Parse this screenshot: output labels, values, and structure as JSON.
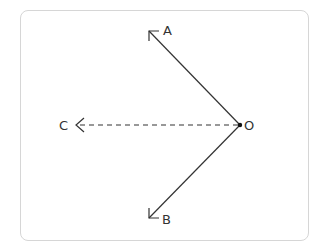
{
  "diagram": {
    "type": "vector-angle",
    "frame": {
      "border_color": "#d6d6d6",
      "background": "#ffffff"
    },
    "origin": {
      "label": "O",
      "x": 240,
      "y": 125
    },
    "rays": [
      {
        "id": "OA",
        "label": "A",
        "from": "O",
        "tip": {
          "x": 149,
          "y": 31
        },
        "style": "solid",
        "label_pos": {
          "x": 168,
          "y": 35
        }
      },
      {
        "id": "OB",
        "label": "B",
        "from": "O",
        "tip": {
          "x": 149,
          "y": 218
        },
        "style": "solid",
        "label_pos": {
          "x": 167,
          "y": 224
        }
      },
      {
        "id": "OC",
        "label": "C",
        "from": "O",
        "tip": {
          "x": 76,
          "y": 125
        },
        "style": "dashed",
        "label_pos": {
          "x": 64,
          "y": 130
        }
      }
    ],
    "labels": {
      "a": "A",
      "b": "B",
      "c": "C",
      "o": "O"
    },
    "stroke_color": "#333333"
  }
}
